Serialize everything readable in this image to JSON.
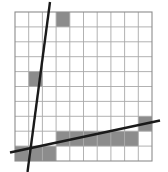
{
  "chart_data": {
    "type": "line",
    "title": "",
    "subtitle": "",
    "xlabel": "",
    "ylabel": "",
    "grid": true,
    "legend_position": "none",
    "xlim": [
      0,
      10
    ],
    "ylim": [
      0,
      10
    ],
    "x_tick_labels": [],
    "y_tick_labels": [],
    "grid_columns": 10,
    "grid_rows": 10,
    "grid_color": "#a9a9a9",
    "border_color": "#8c8c8c",
    "shaded_cell_color": "#8c8c8c",
    "line_color": "#1a1a1a",
    "background_color": "#ffffff",
    "annotations": [
      "Steep line rises from lower-left to upper-right across the grid",
      "Shallow line rises gently from left edge to right edge near the bottom",
      "Gray staircase blocks mark the path between the two lines"
    ],
    "shaded_cells": [
      {
        "col": 3,
        "row": 0
      },
      {
        "col": 1,
        "row": 4
      },
      {
        "col": 9,
        "row": 7
      },
      {
        "col": 3,
        "row": 8
      },
      {
        "col": 4,
        "row": 8
      },
      {
        "col": 5,
        "row": 8
      },
      {
        "col": 6,
        "row": 8
      },
      {
        "col": 7,
        "row": 8
      },
      {
        "col": 8,
        "row": 8
      },
      {
        "col": 0,
        "row": 9
      },
      {
        "col": 1,
        "row": 9
      },
      {
        "col": 2,
        "row": 9
      }
    ],
    "series": [
      {
        "name": "steep-line",
        "type": "line",
        "slope": -4.1,
        "points": [
          [
            2.55,
            11.2
          ],
          [
            0.9,
            -0.9
          ]
        ],
        "pixel_points": [
          [
            50.0,
            2.0
          ],
          [
            27.5,
            172.0
          ]
        ],
        "color": "#1a1a1a",
        "width": 2.4
      },
      {
        "name": "shallow-line",
        "type": "line",
        "slope": 0.21,
        "points": [
          [
            -0.3,
            0.55
          ],
          [
            10.6,
            2.65
          ]
        ],
        "pixel_points": [
          [
            10.0,
            152.5
          ],
          [
            160.0,
            120.5
          ]
        ],
        "color": "#1a1a1a",
        "width": 2.4
      }
    ],
    "plot_area_pixels": {
      "x": 15,
      "y": 12,
      "width": 137,
      "height": 149
    }
  },
  "figure": {
    "alt": "Ten by ten grid with two straight lines and gray shaded staircase cells"
  }
}
